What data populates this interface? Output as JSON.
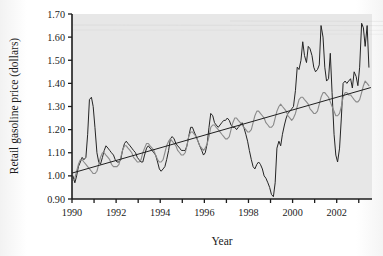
{
  "chart_data": {
    "type": "line",
    "title": "",
    "xlabel": "Year",
    "ylabel": "Retail gasoline price (dollars)",
    "xlim": [
      1990.0,
      2003.6
    ],
    "ylim": [
      0.9,
      1.7
    ],
    "ytick_labels": [
      "0.90",
      "1.00",
      "1.10",
      "1.20",
      "1.30",
      "1.40",
      "1.50",
      "1.60",
      "1.70"
    ],
    "ytick_values": [
      0.9,
      1.0,
      1.1,
      1.2,
      1.3,
      1.4,
      1.5,
      1.6,
      1.7
    ],
    "xtick_labels": [
      "1990",
      "1992",
      "1994",
      "1996",
      "1998",
      "2000",
      "2002"
    ],
    "xtick_values": [
      1990,
      1992,
      1994,
      1996,
      1998,
      2000,
      2002
    ],
    "xminor_values": [
      1991,
      1993,
      1995,
      1997,
      1999,
      2001,
      2003
    ],
    "grid": false,
    "legend": "none",
    "background_color": "#e7e7e7",
    "frame_color": "#1c1c1c",
    "series": [
      {
        "name": "Monthly retail gasoline price",
        "color": "#242424",
        "width": 1.0,
        "x": [
          1990.04,
          1990.13,
          1990.21,
          1990.29,
          1990.38,
          1990.46,
          1990.54,
          1990.63,
          1990.71,
          1990.79,
          1990.88,
          1990.96,
          1991.04,
          1991.13,
          1991.21,
          1991.29,
          1991.38,
          1991.46,
          1991.54,
          1991.63,
          1991.71,
          1991.79,
          1991.88,
          1991.96,
          1992.04,
          1992.13,
          1992.21,
          1992.29,
          1992.38,
          1992.46,
          1992.54,
          1992.63,
          1992.71,
          1992.79,
          1992.88,
          1992.96,
          1993.04,
          1993.13,
          1993.21,
          1993.29,
          1993.38,
          1993.46,
          1993.54,
          1993.63,
          1993.71,
          1993.79,
          1993.88,
          1993.96,
          1994.04,
          1994.13,
          1994.21,
          1994.29,
          1994.38,
          1994.46,
          1994.54,
          1994.63,
          1994.71,
          1994.79,
          1994.88,
          1994.96,
          1995.04,
          1995.13,
          1995.21,
          1995.29,
          1995.38,
          1995.46,
          1995.54,
          1995.63,
          1995.71,
          1995.79,
          1995.88,
          1995.96,
          1996.04,
          1996.13,
          1996.21,
          1996.29,
          1996.38,
          1996.46,
          1996.54,
          1996.63,
          1996.71,
          1996.79,
          1996.88,
          1996.96,
          1997.04,
          1997.13,
          1997.21,
          1997.29,
          1997.38,
          1997.46,
          1997.54,
          1997.63,
          1997.71,
          1997.79,
          1997.88,
          1997.96,
          1998.04,
          1998.13,
          1998.21,
          1998.29,
          1998.38,
          1998.46,
          1998.54,
          1998.63,
          1998.71,
          1998.79,
          1998.88,
          1998.96,
          1999.04,
          1999.13,
          1999.21,
          1999.29,
          1999.38,
          1999.46,
          1999.54,
          1999.63,
          1999.71,
          1999.79,
          1999.88,
          1999.96,
          2000.04,
          2000.13,
          2000.21,
          2000.29,
          2000.38,
          2000.46,
          2000.54,
          2000.63,
          2000.71,
          2000.79,
          2000.88,
          2000.96,
          2001.04,
          2001.13,
          2001.21,
          2001.29,
          2001.38,
          2001.46,
          2001.54,
          2001.63,
          2001.71,
          2001.79,
          2001.88,
          2001.96,
          2002.04,
          2002.13,
          2002.21,
          2002.29,
          2002.38,
          2002.46,
          2002.54,
          2002.63,
          2002.71,
          2002.79,
          2002.88,
          2002.96,
          2003.04,
          2003.13,
          2003.21,
          2003.29,
          2003.38,
          2003.46
        ],
        "y": [
          1.0,
          0.97,
          1.0,
          1.04,
          1.06,
          1.08,
          1.07,
          1.08,
          1.18,
          1.33,
          1.34,
          1.3,
          1.21,
          1.1,
          1.06,
          1.05,
          1.08,
          1.11,
          1.13,
          1.12,
          1.11,
          1.1,
          1.09,
          1.07,
          1.06,
          1.06,
          1.07,
          1.11,
          1.14,
          1.15,
          1.14,
          1.13,
          1.12,
          1.11,
          1.1,
          1.08,
          1.07,
          1.06,
          1.06,
          1.09,
          1.12,
          1.13,
          1.12,
          1.11,
          1.1,
          1.09,
          1.06,
          1.03,
          1.02,
          1.03,
          1.04,
          1.07,
          1.11,
          1.16,
          1.17,
          1.16,
          1.14,
          1.13,
          1.12,
          1.11,
          1.11,
          1.11,
          1.13,
          1.17,
          1.21,
          1.21,
          1.19,
          1.17,
          1.15,
          1.13,
          1.11,
          1.09,
          1.1,
          1.14,
          1.21,
          1.27,
          1.26,
          1.23,
          1.22,
          1.21,
          1.22,
          1.23,
          1.24,
          1.24,
          1.25,
          1.24,
          1.22,
          1.21,
          1.21,
          1.2,
          1.21,
          1.22,
          1.23,
          1.21,
          1.18,
          1.15,
          1.11,
          1.07,
          1.04,
          1.03,
          1.05,
          1.06,
          1.05,
          1.03,
          1.0,
          0.99,
          0.97,
          0.95,
          0.92,
          0.91,
          0.97,
          1.12,
          1.15,
          1.13,
          1.18,
          1.22,
          1.25,
          1.27,
          1.28,
          1.29,
          1.3,
          1.37,
          1.47,
          1.46,
          1.5,
          1.58,
          1.52,
          1.49,
          1.56,
          1.55,
          1.52,
          1.47,
          1.45,
          1.46,
          1.48,
          1.65,
          1.6,
          1.47,
          1.41,
          1.42,
          1.53,
          1.36,
          1.18,
          1.09,
          1.06,
          1.12,
          1.25,
          1.4,
          1.41,
          1.4,
          1.41,
          1.42,
          1.38,
          1.45,
          1.43,
          1.39,
          1.47,
          1.66,
          1.64,
          1.56,
          1.65,
          1.47
        ]
      },
      {
        "name": "Seasonally smoothed price",
        "color": "#8a8a8a",
        "width": 1.1,
        "x": [
          1990.04,
          1990.13,
          1990.21,
          1990.29,
          1990.38,
          1990.46,
          1990.54,
          1990.63,
          1990.71,
          1990.79,
          1990.88,
          1990.96,
          1991.04,
          1991.13,
          1991.21,
          1991.29,
          1991.38,
          1991.46,
          1991.54,
          1991.63,
          1991.71,
          1991.79,
          1991.88,
          1991.96,
          1992.04,
          1992.13,
          1992.21,
          1992.29,
          1992.38,
          1992.46,
          1992.54,
          1992.63,
          1992.71,
          1992.79,
          1992.88,
          1992.96,
          1993.04,
          1993.13,
          1993.21,
          1993.29,
          1993.38,
          1993.46,
          1993.54,
          1993.63,
          1993.71,
          1993.79,
          1993.88,
          1993.96,
          1994.04,
          1994.13,
          1994.21,
          1994.29,
          1994.38,
          1994.46,
          1994.54,
          1994.63,
          1994.71,
          1994.79,
          1994.88,
          1994.96,
          1995.04,
          1995.13,
          1995.21,
          1995.29,
          1995.38,
          1995.46,
          1995.54,
          1995.63,
          1995.71,
          1995.79,
          1995.88,
          1995.96,
          1996.04,
          1996.13,
          1996.21,
          1996.29,
          1996.38,
          1996.46,
          1996.54,
          1996.63,
          1996.71,
          1996.79,
          1996.88,
          1996.96,
          1997.04,
          1997.13,
          1997.21,
          1997.29,
          1997.38,
          1997.46,
          1997.54,
          1997.63,
          1997.71,
          1997.79,
          1997.88,
          1997.96,
          1998.04,
          1998.13,
          1998.21,
          1998.29,
          1998.38,
          1998.46,
          1998.54,
          1998.63,
          1998.71,
          1998.79,
          1998.88,
          1998.96,
          1999.04,
          1999.13,
          1999.21,
          1999.29,
          1999.38,
          1999.46,
          1999.54,
          1999.63,
          1999.71,
          1999.79,
          1999.88,
          1999.96,
          2000.04,
          2000.13,
          2000.21,
          2000.29,
          2000.38,
          2000.46,
          2000.54,
          2000.63,
          2000.71,
          2000.79,
          2000.88,
          2000.96,
          2001.04,
          2001.13,
          2001.21,
          2001.29,
          2001.38,
          2001.46,
          2001.54,
          2001.63,
          2001.71,
          2001.79,
          2001.88,
          2001.96,
          2002.04,
          2002.13,
          2002.21,
          2002.29,
          2002.38,
          2002.46,
          2002.54,
          2002.63,
          2002.71,
          2002.79,
          2002.88,
          2002.96,
          2003.04,
          2003.13,
          2003.21,
          2003.29,
          2003.38,
          2003.46
        ],
        "y": [
          0.98,
          0.99,
          1.02,
          1.05,
          1.07,
          1.07,
          1.06,
          1.05,
          1.04,
          1.03,
          1.02,
          1.01,
          1.01,
          1.02,
          1.05,
          1.08,
          1.1,
          1.1,
          1.09,
          1.08,
          1.07,
          1.05,
          1.04,
          1.04,
          1.04,
          1.05,
          1.08,
          1.11,
          1.13,
          1.13,
          1.12,
          1.11,
          1.1,
          1.08,
          1.07,
          1.06,
          1.06,
          1.07,
          1.1,
          1.12,
          1.14,
          1.14,
          1.13,
          1.12,
          1.11,
          1.09,
          1.07,
          1.06,
          1.06,
          1.07,
          1.1,
          1.13,
          1.15,
          1.16,
          1.15,
          1.14,
          1.13,
          1.11,
          1.1,
          1.09,
          1.09,
          1.1,
          1.13,
          1.17,
          1.19,
          1.19,
          1.18,
          1.17,
          1.15,
          1.13,
          1.12,
          1.11,
          1.12,
          1.14,
          1.17,
          1.21,
          1.22,
          1.22,
          1.21,
          1.2,
          1.19,
          1.18,
          1.17,
          1.16,
          1.16,
          1.17,
          1.2,
          1.23,
          1.25,
          1.25,
          1.24,
          1.23,
          1.22,
          1.21,
          1.2,
          1.19,
          1.19,
          1.2,
          1.23,
          1.26,
          1.28,
          1.28,
          1.27,
          1.26,
          1.25,
          1.23,
          1.22,
          1.21,
          1.21,
          1.22,
          1.25,
          1.28,
          1.3,
          1.31,
          1.3,
          1.29,
          1.28,
          1.26,
          1.25,
          1.24,
          1.25,
          1.27,
          1.3,
          1.33,
          1.34,
          1.34,
          1.33,
          1.32,
          1.31,
          1.29,
          1.28,
          1.27,
          1.27,
          1.28,
          1.31,
          1.34,
          1.36,
          1.36,
          1.35,
          1.34,
          1.32,
          1.3,
          1.28,
          1.26,
          1.26,
          1.27,
          1.3,
          1.34,
          1.36,
          1.36,
          1.35,
          1.35,
          1.34,
          1.33,
          1.32,
          1.32,
          1.33,
          1.36,
          1.39,
          1.41,
          1.4,
          1.39
        ]
      }
    ],
    "trendline": {
      "name": "Least-squares trend line",
      "color": "#1f1f1f",
      "width": 1.0,
      "x": [
        1990.0,
        2003.55
      ],
      "y": [
        1.012,
        1.382
      ]
    }
  }
}
